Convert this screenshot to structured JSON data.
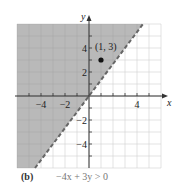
{
  "chart_data": {
    "type": "area",
    "title": "",
    "subtitle": "",
    "panel_label": "(b)",
    "inequality": "−4x + 3y > 0",
    "xlabel": "x",
    "ylabel": "y",
    "xlim": [
      -6,
      6
    ],
    "ylim": [
      -6,
      6
    ],
    "grid": true,
    "x_ticks": [
      -4,
      -2,
      4
    ],
    "y_ticks": [
      4,
      2,
      -2,
      -4
    ],
    "boundary_line": {
      "equation": "y = (4/3)x",
      "style": "dashed",
      "points": [
        [
          -4.5,
          -6
        ],
        [
          0,
          0
        ],
        [
          4.5,
          6
        ]
      ]
    },
    "shaded_region": "above boundary line (upper-left)",
    "test_point": {
      "x": 1,
      "y": 3,
      "label": "(1, 3)"
    }
  },
  "colors": {
    "shade": "#b9b9b9",
    "grid": "#d2d2d2",
    "grid_on_shade": "#a9a9a9",
    "axis": "#333333",
    "dash": "#666666"
  }
}
